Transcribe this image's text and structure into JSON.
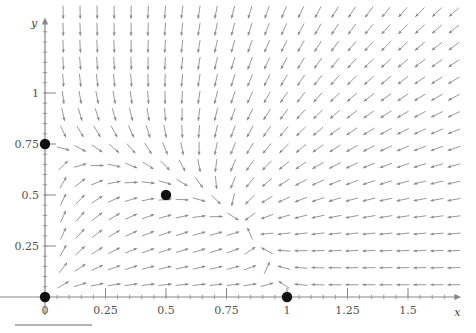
{
  "figure": {
    "title": "",
    "background_color": "#ffffff",
    "axis_color": "#888888",
    "arrow_color": "#8c8c8c",
    "point_color": "#111111",
    "label_color": "#555555",
    "rule_color": "#999999"
  },
  "axes": {
    "x_axis_name": "x",
    "y_axis_name": "y",
    "x_ticks": [
      {
        "value": 0,
        "label": "0"
      },
      {
        "value": 0.25,
        "label": "0.25"
      },
      {
        "value": 0.5,
        "label": "0.5"
      },
      {
        "value": 0.75,
        "label": "0.75"
      },
      {
        "value": 1,
        "label": "1"
      },
      {
        "value": 1.25,
        "label": "1.25"
      },
      {
        "value": 1.5,
        "label": "1.5"
      }
    ],
    "y_ticks": [
      {
        "value": 0.25,
        "label": "0.25"
      },
      {
        "value": 0.5,
        "label": "0.5"
      },
      {
        "value": 0.75,
        "label": "0.75"
      },
      {
        "value": 1,
        "label": "1"
      }
    ],
    "x_range": [
      -0.19,
      1.72
    ],
    "y_range": [
      -0.09,
      1.37
    ],
    "minor_tick_step": 0.05
  },
  "chart_data": {
    "type": "scatter",
    "title": "",
    "xlabel": "x",
    "ylabel": "y",
    "xlim": [
      -0.19,
      1.72
    ],
    "ylim": [
      -0.09,
      1.37
    ],
    "grid": false,
    "legend": "none",
    "field": {
      "kind": "direction-field",
      "u_expression": "x*(1 - x - 0.5*y)",
      "v_expression": "y*(0.75 - y - 0.5*x)",
      "normalized": true,
      "grid_nx": 24,
      "grid_ny": 17,
      "x_start": 0.075,
      "x_step": 0.0702,
      "y_start": 0.06,
      "y_step": 0.0835,
      "arrow_length_px": 13,
      "head_size_px": 3.6
    },
    "critical_points": [
      {
        "x": 0,
        "y": 0,
        "label": "",
        "type": "unstable-node"
      },
      {
        "x": 0,
        "y": 0.75,
        "label": "",
        "type": "saddle"
      },
      {
        "x": 0.5,
        "y": 0.5,
        "label": "",
        "type": "saddle"
      },
      {
        "x": 1,
        "y": 0,
        "label": "",
        "type": "saddle"
      }
    ]
  },
  "footer_rule": {
    "visible": true
  }
}
